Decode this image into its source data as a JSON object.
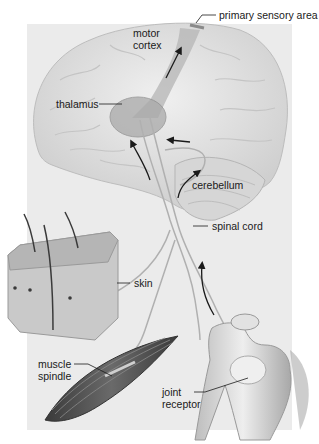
{
  "diagram": {
    "labels": {
      "primary_sensory_area": "primary sensory area",
      "motor_cortex_line1": "motor",
      "motor_cortex_line2": "cortex",
      "thalamus": "thalamus",
      "cerebellum": "cerebellum",
      "spinal_cord": "spinal cord",
      "skin": "skin",
      "muscle_spindle_line1": "muscle",
      "muscle_spindle_line2": "spindle",
      "joint_receptor_line1": "joint",
      "joint_receptor_line2": "receptor"
    },
    "structures": [
      "brain",
      "motor cortex",
      "primary sensory area",
      "thalamus",
      "cerebellum",
      "spinal cord",
      "skin",
      "muscle spindle",
      "joint receptor"
    ],
    "colors": {
      "background_panel": "#ebebeb",
      "brain": "#dcdcdc",
      "pathway": "#b0b0b0",
      "arrow": "#1a1a1a",
      "muscle": "#555555",
      "bone": "#d8d8d8"
    }
  }
}
